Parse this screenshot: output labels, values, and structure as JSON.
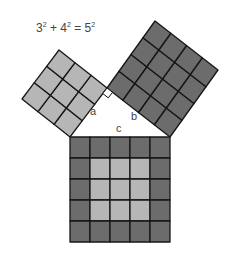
{
  "equation": {
    "terms": [
      {
        "base": "3",
        "exp": "2"
      },
      {
        "base": "4",
        "exp": "2"
      },
      {
        "base": "5",
        "exp": "2"
      }
    ],
    "op_plus": " + ",
    "op_equals": " = "
  },
  "labels": {
    "a": "a",
    "b": "b",
    "c": "c"
  },
  "colors": {
    "light": "#b6b6b6",
    "dark": "#6c6c6c",
    "grid_line": "#161616",
    "right_angle_marker": "#ffffff"
  },
  "squares": [
    {
      "name": "square-a",
      "side_cells": 3,
      "origin": [
        70,
        137
      ],
      "u": [
        37,
        -49
      ],
      "v": [
        -48,
        -38
      ],
      "pattern": "all-light"
    },
    {
      "name": "square-b",
      "side_cells": 4,
      "origin": [
        170,
        137
      ],
      "u": [
        -63,
        -49
      ],
      "v": [
        48,
        -67
      ],
      "pattern": "all-dark"
    },
    {
      "name": "square-c",
      "side_cells": 5,
      "origin": [
        70,
        137
      ],
      "u": [
        100,
        0
      ],
      "v": [
        0,
        105
      ],
      "pattern": "dark-border-light-center"
    }
  ],
  "right_angle_marker": {
    "corner": [
      107,
      88
    ],
    "size": 7
  }
}
